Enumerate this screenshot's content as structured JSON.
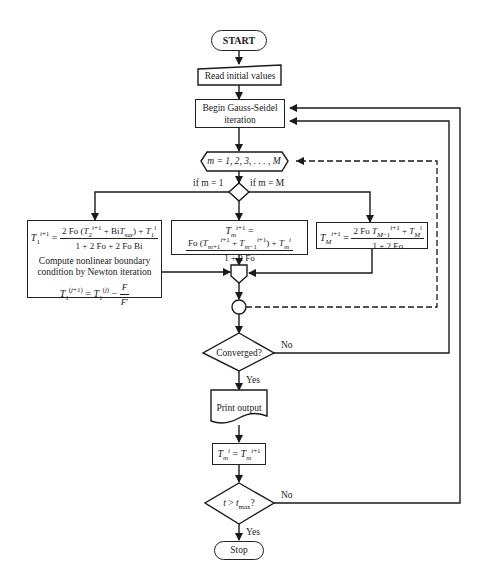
{
  "diagram": {
    "type": "flowchart",
    "nodes": {
      "start": {
        "label": "START",
        "shape": "terminal"
      },
      "read": {
        "label": "Read initial values",
        "shape": "manual-input"
      },
      "gauss_seidel": {
        "label": "Begin Gauss-Seidel iteration",
        "shape": "process"
      },
      "loop": {
        "label": "m = 1, 2, 3, . . . , M",
        "shape": "loop-hexagon"
      },
      "branch": {
        "shape": "decision",
        "left_label": "if m = 1",
        "right_label": "if m = M"
      },
      "boundary_left": {
        "equation_lhs": "T1^(i+1) =",
        "equation_num": "2 Fo (T2^(i+1) + Bi T_sur) + T1^i",
        "equation_den": "1 + 2 Fo + 2 Fo Bi",
        "note": "Compute nonlinear boundary condition by Newton iteration",
        "newton": "T1^(j+1) = T1^(j) − F / F′"
      },
      "interior": {
        "equation_lhs": "Tm^(i+1) =",
        "equation_num": "Fo (T(m+1)^(i+1) + T(m−1)^(i+1)) + Tm^i",
        "equation_den": "1 + 2 Fo"
      },
      "boundary_right": {
        "equation_lhs": "TM^(i+1) =",
        "equation_num": "2 Fo T(M−1)^(i+1) + TM^i",
        "equation_den": "1 + 2 Fo"
      },
      "converged": {
        "label": "Converged?",
        "shape": "decision",
        "yes": "Yes",
        "no": "No"
      },
      "print": {
        "label": "Print output",
        "shape": "document"
      },
      "update": {
        "label": "Tm^i = Tm^(i+1)",
        "shape": "process"
      },
      "time_check": {
        "label": "t > t_max?",
        "shape": "decision",
        "yes": "Yes",
        "no": "No"
      },
      "stop": {
        "label": "Stop",
        "shape": "terminal"
      }
    },
    "text": {
      "start": "START",
      "read": "Read initial values",
      "gs1": "Begin Gauss-Seidel",
      "gs2": "iteration",
      "loop": "m = 1, 2, 3, . . . , M",
      "if_left": "if m = 1",
      "if_right": "if m = M",
      "note1": "Compute nonlinear boundary",
      "note2": "condition by Newton iteration",
      "converged": "Converged?",
      "print": "Print output",
      "yes": "Yes",
      "no": "No",
      "stop": "Stop"
    }
  }
}
